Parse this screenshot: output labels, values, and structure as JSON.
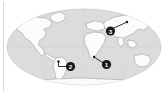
{
  "figure": {
    "title": "World map with three numbered location markers",
    "width": 167,
    "height": 94,
    "background_color": "#ffffff",
    "border_rule_color": "#d8d8d8"
  },
  "map": {
    "projection": "oval",
    "ocean_color": "#dcdcdc",
    "ocean_outline_color": "#c6c6c6",
    "land_color": "#fbfbfb",
    "land_outline_color": "#9a9a9a",
    "graticule_color": "#cfcfcf",
    "center_x": 84,
    "center_y": 47,
    "radius_x": 77,
    "radius_y": 38
  },
  "markers": [
    {
      "id": "marker-1",
      "label": "1",
      "circle_x": 106.5,
      "circle_y": 64.5,
      "target_x": 94.0,
      "target_y": 57.0,
      "region": "Indian Ocean off southern Africa"
    },
    {
      "id": "marker-2",
      "label": "2",
      "circle_x": 70.5,
      "circle_y": 66.5,
      "target_x": 58.5,
      "target_y": 61.5,
      "region": "South Atlantic off southern South America"
    },
    {
      "id": "marker-3",
      "label": "3",
      "circle_x": 110.5,
      "circle_y": 31.0,
      "target_x": 127.0,
      "target_y": 22.0,
      "region": "Northern Eurasia"
    }
  ],
  "marker_style": {
    "fill_color": "#1a1a1a",
    "text_color": "#ffffff",
    "radius": 4.6,
    "leader_line_color": "#1a1a1a",
    "leader_line_width": 0.9,
    "leader_dot_radius": 1.2
  },
  "continents": [
    "North America",
    "South America",
    "Europe",
    "Africa",
    "Asia",
    "Australia",
    "Antarctica",
    "Greenland"
  ]
}
